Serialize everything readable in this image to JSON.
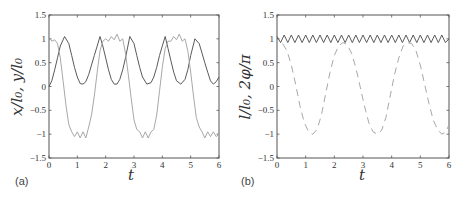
{
  "figure": {
    "panels": [
      {
        "id": "a",
        "label": "(a)",
        "xlabel": "t",
        "ylabel": "x/l₀, y/l₀"
      },
      {
        "id": "b",
        "label": "(b)",
        "xlabel": "t",
        "ylabel": "l/l₀, 2φ/π"
      }
    ],
    "colors": {
      "dark_line": "#5a5a5a",
      "light_line": "#a8a8a8",
      "axes": "#555555",
      "text": "#333333"
    }
  },
  "chart_data": [
    {
      "type": "line",
      "panel": "(a)",
      "title": "",
      "xlabel": "t",
      "ylabel": "x/l0, y/l0",
      "xlim": [
        0,
        6
      ],
      "ylim": [
        -1.5,
        1.5
      ],
      "xticks": [
        0,
        1,
        2,
        3,
        4,
        5,
        6
      ],
      "yticks": [
        -1.5,
        -1,
        -0.5,
        0,
        0.5,
        1,
        1.5
      ],
      "xtick_labels": [
        "0",
        "1",
        "2",
        "3",
        "4",
        "5",
        "6"
      ],
      "ytick_labels": [
        "−1.5",
        "−1",
        "−0.5",
        "0",
        "0.5",
        "1",
        "1.5"
      ],
      "grid": false,
      "legend": null,
      "series": [
        {
          "name": "x/l0",
          "style": "solid",
          "color": "#5a5a5a",
          "x": [
            0,
            0.1,
            0.2,
            0.3,
            0.4,
            0.55,
            0.7,
            0.8,
            0.9,
            1.0,
            1.1,
            1.2,
            1.3,
            1.4,
            1.5,
            1.6,
            1.7,
            1.8,
            1.9,
            2.0,
            2.1,
            2.2,
            2.3,
            2.4,
            2.5,
            2.6,
            2.7,
            2.85,
            3.0,
            3.1,
            3.2,
            3.3,
            3.45,
            3.6,
            3.7,
            3.8,
            3.9,
            4.0,
            4.1,
            4.2,
            4.3,
            4.4,
            4.5,
            4.65,
            4.8,
            4.9,
            5.0,
            5.15,
            5.3,
            5.4,
            5.5,
            5.6,
            5.7,
            5.8,
            5.9,
            6.0
          ],
          "y": [
            0.0,
            0.12,
            0.35,
            0.6,
            0.85,
            1.05,
            0.9,
            0.65,
            0.4,
            0.2,
            0.06,
            0.05,
            0.1,
            0.25,
            0.45,
            0.65,
            0.85,
            1.05,
            0.85,
            0.6,
            0.35,
            0.15,
            0.05,
            0.05,
            0.15,
            0.35,
            0.6,
            1.05,
            0.9,
            0.65,
            0.4,
            0.2,
            0.05,
            0.08,
            0.2,
            0.4,
            0.65,
            0.85,
            1.05,
            0.8,
            0.55,
            0.3,
            0.12,
            0.05,
            0.15,
            0.35,
            0.65,
            1.0,
            0.9,
            0.7,
            0.5,
            0.3,
            0.12,
            0.05,
            0.1,
            0.2
          ]
        },
        {
          "name": "y/l0",
          "style": "solid",
          "color": "#a8a8a8",
          "x": [
            0,
            0.1,
            0.2,
            0.3,
            0.4,
            0.5,
            0.6,
            0.7,
            0.8,
            0.9,
            1.0,
            1.1,
            1.2,
            1.3,
            1.4,
            1.5,
            1.6,
            1.7,
            1.8,
            1.9,
            2.0,
            2.1,
            2.2,
            2.3,
            2.4,
            2.5,
            2.6,
            2.7,
            2.8,
            2.9,
            3.0,
            3.1,
            3.2,
            3.3,
            3.4,
            3.5,
            3.6,
            3.7,
            3.8,
            3.9,
            4.0,
            4.1,
            4.2,
            4.3,
            4.4,
            4.5,
            4.6,
            4.7,
            4.8,
            4.9,
            5.0,
            5.1,
            5.2,
            5.3,
            5.4,
            5.5,
            5.6,
            5.7,
            5.8,
            5.9,
            6.0
          ],
          "y": [
            1.05,
            0.95,
            0.98,
            0.9,
            0.6,
            0.1,
            -0.4,
            -0.8,
            -0.95,
            -1.05,
            -0.95,
            -1.08,
            -0.95,
            -1.08,
            -0.85,
            -0.6,
            -0.2,
            0.3,
            0.75,
            0.95,
            1.0,
            0.95,
            1.05,
            0.98,
            1.1,
            0.95,
            1.0,
            0.7,
            0.25,
            -0.25,
            -0.7,
            -0.9,
            -0.95,
            -1.08,
            -0.95,
            -1.08,
            -0.95,
            -0.9,
            -0.6,
            -0.1,
            0.4,
            0.8,
            0.95,
            0.95,
            1.05,
            0.98,
            1.1,
            0.95,
            1.0,
            0.75,
            0.3,
            -0.2,
            -0.65,
            -0.85,
            -0.95,
            -1.08,
            -0.95,
            -1.05,
            -0.95,
            -1.05,
            -1.0
          ]
        }
      ]
    },
    {
      "type": "line",
      "panel": "(b)",
      "title": "",
      "xlabel": "t",
      "ylabel": "l/l0, 2φ/π",
      "xlim": [
        0,
        6
      ],
      "ylim": [
        -1.5,
        1.5
      ],
      "xticks": [
        0,
        1,
        2,
        3,
        4,
        5,
        6
      ],
      "yticks": [
        -1.5,
        -1,
        -0.5,
        0,
        0.5,
        1,
        1.5
      ],
      "xtick_labels": [
        "0",
        "1",
        "2",
        "3",
        "4",
        "5",
        "6"
      ],
      "ytick_labels": [
        "−1.5",
        "−1",
        "−0.5",
        "0",
        "0.5",
        "1",
        "1.5"
      ],
      "grid": false,
      "legend": null,
      "series": [
        {
          "name": "l/l0",
          "style": "solid",
          "color": "#5a5a5a",
          "x": [
            0,
            0.125,
            0.25,
            0.375,
            0.5,
            0.625,
            0.75,
            0.875,
            1.0,
            1.125,
            1.25,
            1.375,
            1.5,
            1.625,
            1.75,
            1.875,
            2.0,
            2.125,
            2.25,
            2.375,
            2.5,
            2.625,
            2.75,
            2.875,
            3.0,
            3.125,
            3.25,
            3.375,
            3.5,
            3.625,
            3.75,
            3.875,
            4.0,
            4.125,
            4.25,
            4.375,
            4.5,
            4.625,
            4.75,
            4.875,
            5.0,
            5.125,
            5.25,
            5.375,
            5.5,
            5.625,
            5.75,
            5.875,
            6.0
          ],
          "y": [
            1.05,
            0.92,
            1.08,
            0.92,
            1.08,
            0.92,
            1.08,
            0.92,
            1.08,
            0.92,
            1.08,
            0.92,
            1.08,
            0.92,
            1.08,
            0.92,
            1.08,
            0.92,
            1.08,
            0.92,
            1.08,
            0.92,
            1.08,
            0.92,
            1.08,
            0.92,
            1.08,
            0.92,
            1.08,
            0.92,
            1.08,
            0.92,
            1.08,
            0.92,
            1.08,
            0.92,
            1.08,
            0.92,
            1.08,
            0.92,
            1.08,
            0.92,
            1.08,
            0.92,
            1.08,
            0.92,
            1.08,
            0.92,
            1.0
          ]
        },
        {
          "name": "2φ/π",
          "style": "dashed",
          "color": "#a8a8a8",
          "x": [
            0.2,
            0.35,
            0.5,
            0.65,
            0.8,
            0.95,
            1.1,
            1.25,
            1.4,
            1.55,
            1.7,
            1.85,
            2.0,
            2.15,
            2.3,
            2.45,
            2.6,
            2.75,
            2.9,
            3.05,
            3.2,
            3.35,
            3.5,
            3.65,
            3.8,
            3.95,
            4.1,
            4.25,
            4.4,
            4.55,
            4.7,
            4.85,
            5.0,
            5.15,
            5.3,
            5.45,
            5.6,
            5.75,
            5.9,
            6.0
          ],
          "y": [
            0.9,
            0.75,
            0.45,
            0.05,
            -0.4,
            -0.75,
            -0.95,
            -1.0,
            -0.9,
            -0.6,
            -0.15,
            0.3,
            0.65,
            0.85,
            0.92,
            0.88,
            0.7,
            0.4,
            0.0,
            -0.4,
            -0.75,
            -0.95,
            -1.0,
            -0.92,
            -0.65,
            -0.2,
            0.25,
            0.6,
            0.85,
            0.92,
            0.9,
            0.75,
            0.45,
            0.05,
            -0.35,
            -0.7,
            -0.9,
            -1.0,
            -0.95,
            -0.8
          ]
        }
      ]
    }
  ]
}
